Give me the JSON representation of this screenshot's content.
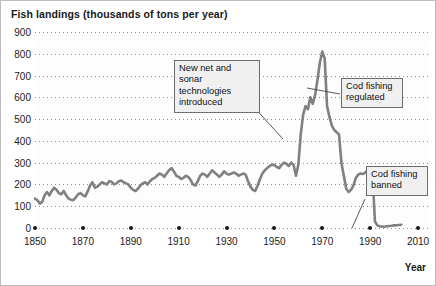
{
  "chart_data": {
    "type": "line",
    "title": "Fish landings (thousands of tons per year)",
    "xlabel": "Year",
    "ylabel": "Fish landings (thousands of tons per year)",
    "xlim": [
      1850,
      2015
    ],
    "ylim": [
      0,
      900
    ],
    "grid": true,
    "legend": false,
    "line_color": "#808080",
    "y_ticks": [
      900,
      800,
      700,
      600,
      500,
      400,
      300,
      200,
      100,
      0
    ],
    "x_ticks": [
      1850,
      1870,
      1890,
      1910,
      1930,
      1950,
      1970,
      1990,
      2010
    ],
    "series": [
      {
        "name": "Fish landings",
        "x": [
          1850,
          1851,
          1852,
          1853,
          1854,
          1855,
          1856,
          1857,
          1858,
          1859,
          1860,
          1861,
          1862,
          1863,
          1864,
          1865,
          1866,
          1867,
          1868,
          1869,
          1870,
          1871,
          1872,
          1873,
          1874,
          1875,
          1876,
          1877,
          1878,
          1879,
          1880,
          1881,
          1882,
          1883,
          1884,
          1885,
          1886,
          1887,
          1888,
          1889,
          1890,
          1891,
          1892,
          1893,
          1894,
          1895,
          1896,
          1897,
          1898,
          1899,
          1900,
          1901,
          1902,
          1903,
          1904,
          1905,
          1906,
          1907,
          1908,
          1909,
          1910,
          1911,
          1912,
          1913,
          1914,
          1915,
          1916,
          1917,
          1918,
          1919,
          1920,
          1921,
          1922,
          1923,
          1924,
          1925,
          1926,
          1927,
          1928,
          1929,
          1930,
          1931,
          1932,
          1933,
          1934,
          1935,
          1936,
          1937,
          1938,
          1939,
          1940,
          1941,
          1942,
          1943,
          1944,
          1945,
          1946,
          1947,
          1948,
          1949,
          1950,
          1951,
          1952,
          1953,
          1954,
          1955,
          1956,
          1957,
          1958,
          1959,
          1960,
          1961,
          1962,
          1963,
          1964,
          1965,
          1966,
          1967,
          1968,
          1969,
          1970,
          1971,
          1972,
          1973,
          1974,
          1975,
          1976,
          1977,
          1978,
          1979,
          1980,
          1981,
          1982,
          1983,
          1984,
          1985,
          1986,
          1987,
          1988,
          1989,
          1990,
          1991,
          1992,
          1993,
          1994,
          1995,
          1996,
          1997,
          1998,
          1999,
          2000,
          2001,
          2002,
          2003
        ],
        "values": [
          135,
          128,
          112,
          120,
          150,
          165,
          150,
          170,
          185,
          175,
          160,
          155,
          170,
          150,
          135,
          130,
          128,
          140,
          155,
          160,
          150,
          145,
          168,
          195,
          210,
          185,
          190,
          200,
          210,
          205,
          200,
          215,
          212,
          200,
          205,
          215,
          218,
          210,
          205,
          200,
          185,
          175,
          170,
          180,
          195,
          205,
          210,
          200,
          215,
          225,
          230,
          240,
          250,
          245,
          235,
          250,
          265,
          275,
          260,
          240,
          235,
          225,
          230,
          240,
          235,
          220,
          200,
          195,
          215,
          240,
          250,
          245,
          235,
          250,
          265,
          255,
          245,
          235,
          245,
          260,
          250,
          245,
          250,
          255,
          250,
          240,
          245,
          250,
          245,
          215,
          190,
          175,
          170,
          195,
          225,
          250,
          265,
          275,
          285,
          290,
          290,
          280,
          275,
          290,
          300,
          295,
          285,
          300,
          290,
          240,
          290,
          430,
          520,
          560,
          545,
          600,
          570,
          610,
          680,
          760,
          810,
          780,
          560,
          510,
          470,
          450,
          440,
          430,
          300,
          240,
          180,
          165,
          175,
          195,
          230,
          245,
          250,
          248,
          255,
          265,
          260,
          240,
          30,
          12,
          8,
          7,
          6,
          8,
          9,
          10,
          12,
          13,
          14,
          15
        ]
      }
    ],
    "annotations": [
      {
        "id": "new-net-sonar",
        "text": "New net and\nsonar technologies\nintroduced",
        "target_year": 1959,
        "target_value": 320
      },
      {
        "id": "cod-regulated",
        "text": "Cod fishing\nregulated",
        "target_year": 1968,
        "target_value": 710
      },
      {
        "id": "cod-banned",
        "text": "Cod fishing\nbanned",
        "target_year": 1993,
        "target_value": 10
      }
    ]
  },
  "callouts": {
    "new_net_sonar": "New net and\nsonar technologies\nintroduced",
    "cod_regulated": "Cod fishing\nregulated",
    "cod_banned": "Cod fishing\nbanned"
  }
}
